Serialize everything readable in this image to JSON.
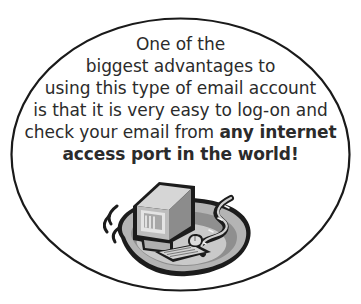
{
  "document": {
    "type": "callout-oval",
    "background_color": "#ffffff",
    "frame": {
      "shape": "ellipse",
      "stroke_color": "#1a1a1a",
      "stroke_width": 2,
      "fill": "none"
    }
  },
  "quote": {
    "text_color": "#2b2b2b",
    "full_text": "One of the biggest advantages to using this type of email account is that it is very easy to log-on and check your email from any internet access port in the world!",
    "lines": [
      {
        "text": "One of the",
        "bold": false
      },
      {
        "text": "biggest advantages to",
        "bold": false
      },
      {
        "text": "using this type of email account",
        "bold": false
      },
      {
        "text": "is that it is very easy to log-on and",
        "bold": false
      },
      {
        "text": "check your email from ",
        "bold": false,
        "emphasis": "any internet"
      },
      {
        "text": "access port in the world!",
        "bold": true
      }
    ]
  },
  "illustration": {
    "name": "computer-workstation-clipart",
    "description": "Grayscale clip art of a desktop computer monitor, keyboard and mouse sitting on a rounded desk blob, with motion lines at the left and a winding path at the right",
    "parts": [
      "motion-lines",
      "monitor",
      "monitor-screen",
      "keyboard",
      "mouse",
      "winding-path",
      "desk-blob"
    ],
    "colors": {
      "outline": "#1c1c1c",
      "blob_light": "#cfcfcf",
      "blob_mid": "#9a9a9a",
      "blob_dark": "#6e6e6e",
      "monitor_face": "#d4d4d4",
      "monitor_side": "#8c8c8c",
      "screen": "#b9b9b9"
    }
  }
}
